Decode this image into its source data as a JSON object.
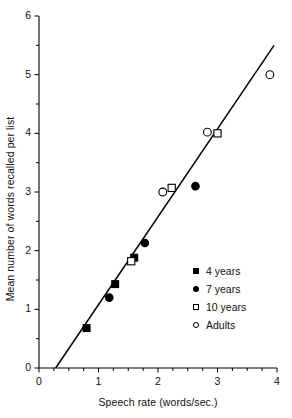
{
  "chart_data": {
    "type": "scatter",
    "title": "",
    "xlabel": "Speech rate (words/sec.)",
    "ylabel": "Mean number of words recalled per list",
    "xlim": [
      0,
      4
    ],
    "ylim": [
      0,
      6
    ],
    "xticks": [
      0,
      1,
      2,
      3,
      4
    ],
    "yticks": [
      0,
      1,
      2,
      3,
      4,
      5,
      6
    ],
    "xtick_labels": [
      "0",
      "1",
      "2",
      "3",
      "4"
    ],
    "ytick_labels": [
      "0",
      "1",
      "2",
      "3",
      "4",
      "5",
      "6"
    ],
    "x_minor_tick_step": 0.25,
    "y_minor_tick_step": 0.5,
    "grid": false,
    "legend_position": "inside-lower-right",
    "series": [
      {
        "name": "4 years",
        "marker": "filled-square",
        "points": [
          {
            "x": 0.8,
            "y": 0.68
          },
          {
            "x": 1.28,
            "y": 1.43
          },
          {
            "x": 1.6,
            "y": 1.88
          }
        ]
      },
      {
        "name": "7 years",
        "marker": "filled-circle",
        "points": [
          {
            "x": 1.18,
            "y": 1.2
          },
          {
            "x": 1.78,
            "y": 2.13
          },
          {
            "x": 2.63,
            "y": 3.1
          }
        ]
      },
      {
        "name": "10 years",
        "marker": "open-square",
        "points": [
          {
            "x": 1.55,
            "y": 1.82
          },
          {
            "x": 2.23,
            "y": 3.07
          },
          {
            "x": 3.0,
            "y": 4.0
          }
        ]
      },
      {
        "name": "Adults",
        "marker": "open-circle",
        "points": [
          {
            "x": 2.08,
            "y": 3.0
          },
          {
            "x": 2.83,
            "y": 4.02
          },
          {
            "x": 3.88,
            "y": 5.0
          }
        ]
      }
    ],
    "fit_line": {
      "type": "linear",
      "x_start": 0.28,
      "y_start": 0.0,
      "x_end": 3.95,
      "y_end": 5.5
    }
  },
  "legend": {
    "items": [
      {
        "label": "4 years",
        "marker": "filled-square-icon"
      },
      {
        "label": "7 years",
        "marker": "filled-circle-icon"
      },
      {
        "label": "10 years",
        "marker": "open-square-icon"
      },
      {
        "label": "Adults",
        "marker": "open-circle-icon"
      }
    ]
  },
  "axes": {
    "x_title": "Speech rate (words/sec.)",
    "y_title": "Mean number of words recalled per list"
  }
}
